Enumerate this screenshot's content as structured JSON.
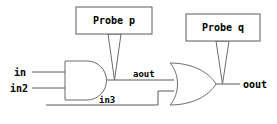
{
  "diagram": {
    "kind": "logic-circuit-schematic",
    "background_color": "#ffffff",
    "line_color": "#5a5a5a",
    "text_color": "#000000",
    "inputs": [
      {
        "name": "in",
        "label": "in"
      },
      {
        "name": "in2",
        "label": "in2"
      },
      {
        "name": "in3",
        "label": "in3"
      }
    ],
    "gates": [
      {
        "name": "and-gate",
        "type": "AND",
        "output_label": "aout"
      },
      {
        "name": "or-gate",
        "type": "OR",
        "output_label": "oout"
      }
    ],
    "wires": [
      {
        "name": "aout",
        "label": "aout"
      },
      {
        "name": "in3",
        "label": "in3"
      },
      {
        "name": "oout",
        "label": "oout"
      }
    ],
    "probes": [
      {
        "name": "probe-p",
        "label": "Probe p",
        "attached_to": "aout"
      },
      {
        "name": "probe-q",
        "label": "Probe q",
        "attached_to": "oout"
      }
    ]
  }
}
